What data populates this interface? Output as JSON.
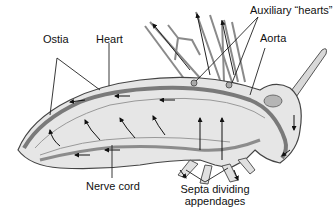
{
  "figure": {
    "labels": {
      "ostia": "Ostia",
      "heart": "Heart",
      "auxiliary_hearts": "Auxiliary “hearts”",
      "aorta": "Aorta",
      "nerve_cord": "Nerve cord",
      "septa_line1": "Septa dividing",
      "septa_line2": "appendages"
    }
  }
}
